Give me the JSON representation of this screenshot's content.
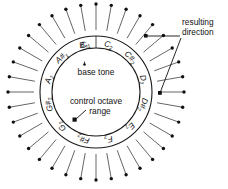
{
  "diagram": {
    "ring": {
      "center_x": 96,
      "center_y": 92,
      "outer_radius": 56,
      "inner_radius": 44,
      "notes": [
        {
          "name": "C",
          "sharp": "",
          "octave": "2"
        },
        {
          "name": "C",
          "sharp": "#",
          "octave": "2"
        },
        {
          "name": "D",
          "sharp": "",
          "octave": "2"
        },
        {
          "name": "D",
          "sharp": "#",
          "octave": "2"
        },
        {
          "name": "E",
          "sharp": "",
          "octave": "2"
        },
        {
          "name": "F",
          "sharp": "",
          "octave": "2"
        },
        {
          "name": "F",
          "sharp": "#",
          "octave": "2"
        },
        {
          "name": "G",
          "sharp": "",
          "octave": "2"
        },
        {
          "name": "G",
          "sharp": "#",
          "octave": "2"
        },
        {
          "name": "A",
          "sharp": "",
          "octave": "2"
        },
        {
          "name": "A",
          "sharp": "#",
          "octave": "1"
        },
        {
          "name": "B",
          "sharp": "",
          "octave": "1"
        }
      ],
      "start_note_small": {
        "name": "C",
        "octave": "1"
      }
    },
    "center_labels": {
      "base_tone": "base tone",
      "control_octave_line1": "control octave",
      "control_octave_line2": "range"
    },
    "annotations": {
      "resulting_direction_line1": "resulting",
      "resulting_direction_line2": "direction"
    },
    "arrows": {
      "count": 36,
      "inner_offset": 6,
      "length": 26,
      "tip_radius": 1.7
    },
    "colors": {
      "ink": "#111111",
      "ring_stroke": "#1a1a1a",
      "arrow": "#4a4a4a",
      "background": "#ffffff"
    }
  }
}
